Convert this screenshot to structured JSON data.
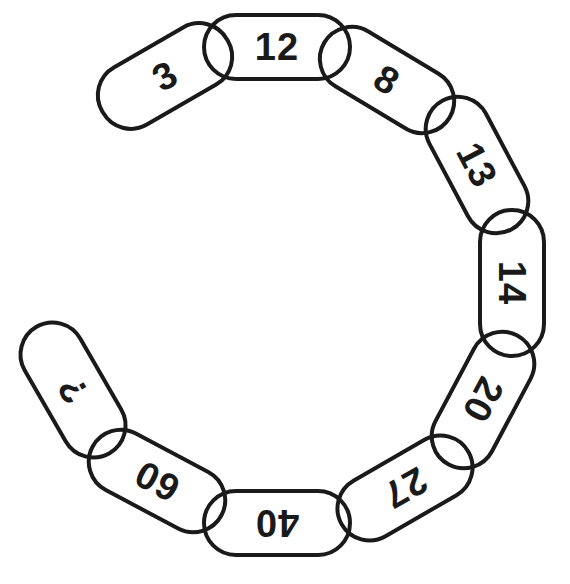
{
  "puzzle": {
    "type": "number-chain",
    "description": "Chain of linked oval links arranged in a C shape, each containing a number; last link contains a question mark",
    "sequence": [
      "3",
      "12",
      "8",
      "13",
      "14",
      "20",
      "27",
      "40",
      "60",
      "?"
    ],
    "line_color": "#1a1a1a",
    "background": "#ffffff",
    "links": [
      {
        "label": "3",
        "cx": 165,
        "cy": 76,
        "w": 148,
        "h": 70,
        "angle": -30
      },
      {
        "label": "12",
        "cx": 277,
        "cy": 47,
        "w": 150,
        "h": 68,
        "angle": 0
      },
      {
        "label": "8",
        "cx": 387,
        "cy": 80,
        "w": 150,
        "h": 68,
        "angle": 31
      },
      {
        "label": "13",
        "cx": 477,
        "cy": 165,
        "w": 150,
        "h": 68,
        "angle": 62
      },
      {
        "label": "14",
        "cx": 512,
        "cy": 283,
        "w": 150,
        "h": 68,
        "angle": 90
      },
      {
        "label": "20",
        "cx": 483,
        "cy": 400,
        "w": 150,
        "h": 68,
        "angle": 118
      },
      {
        "label": "27",
        "cx": 405,
        "cy": 488,
        "w": 150,
        "h": 68,
        "angle": 150
      },
      {
        "label": "40",
        "cx": 277,
        "cy": 523,
        "w": 150,
        "h": 68,
        "angle": 180
      },
      {
        "label": "60",
        "cx": 157,
        "cy": 481,
        "w": 150,
        "h": 68,
        "angle": 208
      },
      {
        "label": "?",
        "cx": 73,
        "cy": 390,
        "w": 150,
        "h": 68,
        "angle": 240
      }
    ]
  }
}
